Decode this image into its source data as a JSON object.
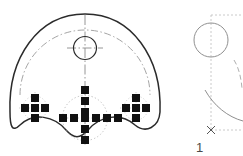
{
  "drawing": {
    "title": "cam-plate-technical-drawing",
    "canvas": {
      "width": 243,
      "height": 156,
      "background": "#ffffff"
    },
    "colors": {
      "outline": "#2b2b2b",
      "centerline": "#8a8a8a",
      "bolt_circle": "#9a9a9a",
      "marker_fill": "#111111",
      "construction": "#bdbdbd",
      "label": "#4a4a4a",
      "detail_curve": "#909090"
    },
    "views": [
      {
        "name": "main-view",
        "description": "front view of cam plate with scalloped lower profile",
        "outline_path": "M 10 112 C 8 60 40 14 85 14 C 130 14 162 60 160 112 C 158 130 142 134 132 124 C 118 110 100 118 88 130 C 78 140 74 140 64 130 C 52 118 34 110 22 124 C 14 132 11 126 10 112 Z"
      },
      {
        "name": "detail-view-right",
        "description": "partial section detail with construction box and arc",
        "label": "1"
      }
    ],
    "features": {
      "top_circle": {
        "name": "center-bore",
        "cx": 85,
        "cy": 48,
        "r": 11
      },
      "vertical_centerline": {
        "x": 85,
        "y1": 15,
        "y2": 145
      },
      "horizontal_centerline": {
        "y": 48,
        "x1": 66,
        "x2": 104
      },
      "bolt_circle_arc": {
        "name": "bolt-circle",
        "cx": 85,
        "cy": 112,
        "r": 65,
        "start_angle_deg": 188,
        "end_angle_deg": 352
      },
      "inner_dashed_circle": {
        "cx": 85,
        "cy": 118,
        "r": 22
      }
    },
    "marker_clusters": [
      {
        "name": "left-bolt-cluster",
        "shape": "plus",
        "center": {
          "x": 35,
          "y": 108
        },
        "square_size": 8,
        "pitch": 10,
        "count": 5,
        "offsets": [
          [
            0,
            -1
          ],
          [
            -1,
            0
          ],
          [
            0,
            0
          ],
          [
            1,
            0
          ],
          [
            0,
            1
          ]
        ]
      },
      {
        "name": "center-bolt-cluster",
        "shape": "large-plus",
        "center": {
          "x": 85,
          "y": 118
        },
        "square_size": 8,
        "pitch": 11,
        "count": 13,
        "offsets": [
          [
            0,
            -3
          ],
          [
            0,
            -2
          ],
          [
            0,
            -1
          ],
          [
            -3,
            0
          ],
          [
            -2,
            0
          ],
          [
            -1,
            0
          ],
          [
            0,
            0
          ],
          [
            1,
            0
          ],
          [
            2,
            0
          ],
          [
            3,
            0
          ],
          [
            0,
            1
          ],
          [
            0,
            2
          ],
          [
            0,
            3
          ]
        ]
      },
      {
        "name": "right-bolt-cluster",
        "shape": "plus",
        "center": {
          "x": 136,
          "y": 108
        },
        "square_size": 8,
        "pitch": 10,
        "count": 5,
        "offsets": [
          [
            0,
            -1
          ],
          [
            -1,
            0
          ],
          [
            0,
            0
          ],
          [
            1,
            0
          ],
          [
            0,
            1
          ]
        ]
      }
    ],
    "detail": {
      "construction_box": {
        "x": 197,
        "y": 14,
        "width": 46,
        "height": 116
      },
      "circle": {
        "cx": 211,
        "cy": 40,
        "r": 17
      },
      "vertical_axis": {
        "x": 211,
        "y1": 14,
        "y2": 130
      },
      "origin_marker": {
        "name": "origin-x-marker",
        "x": 211,
        "y": 130,
        "glyph": "x"
      },
      "arc_path": "M 206 90 C 216 104 230 116 243 120",
      "small_arc_path": "M 232 62 C 238 70 241 80 243 90",
      "baseline": {
        "y": 130,
        "x1": 211,
        "x2": 243
      },
      "label": {
        "text": "1",
        "x": 199,
        "y": 150
      }
    }
  }
}
